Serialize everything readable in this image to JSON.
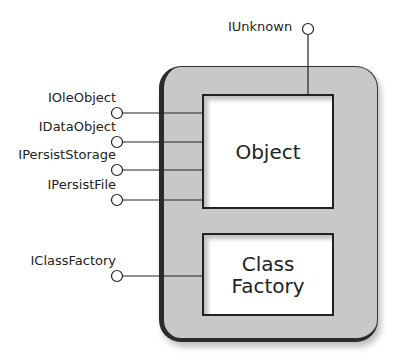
{
  "diagram": {
    "component_boxes": {
      "object": "Object",
      "class_factory_line1": "Class",
      "class_factory_line2": "Factory"
    },
    "interfaces": {
      "iunknown": "IUnknown",
      "ioleobject": "IOleObject",
      "idataobject": "IDataObject",
      "ipersiststorage": "IPersistStorage",
      "ipersistfile": "IPersistFile",
      "iclassfactory": "IClassFactory"
    }
  }
}
